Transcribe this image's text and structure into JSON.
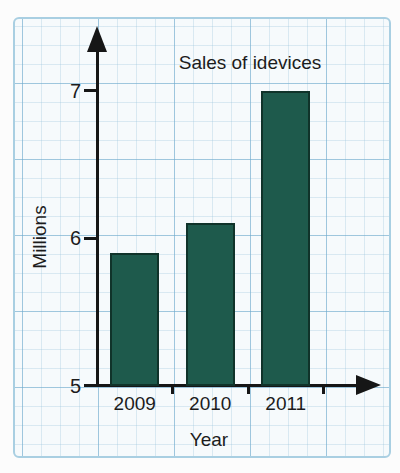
{
  "page": {
    "background": "#fcfcfc"
  },
  "panel": {
    "background": "#f6fafc",
    "border_color": "#a9cfe2",
    "grid_minor_color": "#c9e0ee",
    "grid_major_color": "#9cc4da"
  },
  "chart_data": {
    "type": "bar",
    "title": "Sales of idevices",
    "xlabel": "Year",
    "ylabel": "Millions",
    "categories": [
      "2009",
      "2010",
      "2011"
    ],
    "values": [
      5.9,
      6.1,
      7
    ],
    "y_ticks": [
      5,
      6,
      7
    ],
    "ylim": [
      5,
      7.4
    ],
    "grid": true,
    "legend": false,
    "bar_color": "#1e5a4c",
    "bar_outline_color": "#10332a",
    "axis_color": "#161616",
    "text_color": "#1c1c1c"
  }
}
